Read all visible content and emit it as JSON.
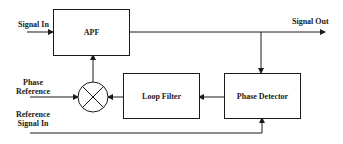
{
  "diagram": {
    "type": "block-diagram",
    "blocks": {
      "apf": {
        "label": "APF"
      },
      "loop_filter": {
        "label": "Loop Filter"
      },
      "phase_detector": {
        "label": "Phase Detector"
      },
      "mixer": {
        "label": "",
        "symbol": "multiplier-circle-x"
      }
    },
    "signals": {
      "signal_in": "Signal In",
      "signal_out": "Signal Out",
      "phase_reference_line1": "Phase",
      "phase_reference_line2": "Reference",
      "reference_signal_in_line1": "Reference",
      "reference_signal_in_line2": "Signal In"
    },
    "connections": [
      {
        "from": "Signal In",
        "to": "APF"
      },
      {
        "from": "APF",
        "to": "Signal Out"
      },
      {
        "from": "APF output",
        "to": "Phase Detector"
      },
      {
        "from": "Reference Signal In",
        "to": "Phase Detector"
      },
      {
        "from": "Phase Detector",
        "to": "Loop Filter"
      },
      {
        "from": "Loop Filter",
        "to": "Mixer"
      },
      {
        "from": "Phase Reference",
        "to": "Mixer"
      },
      {
        "from": "Mixer",
        "to": "APF"
      }
    ],
    "colors": {
      "stroke": "#1a1a1a",
      "background": "#ffffff"
    }
  }
}
